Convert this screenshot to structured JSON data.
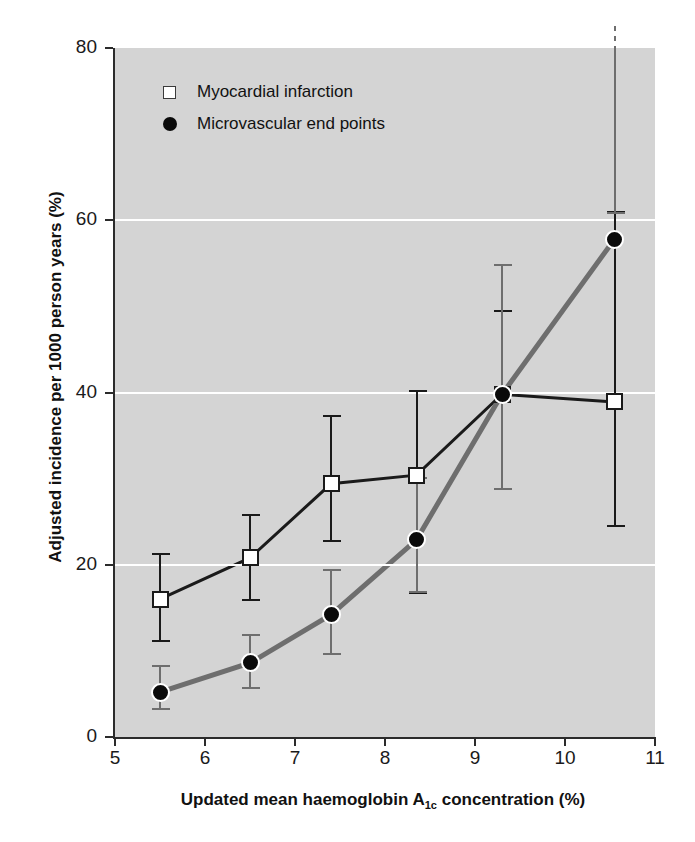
{
  "chart_data": {
    "type": "line",
    "title": "",
    "xlabel": "Updated mean haemoglobin A1c concentration (%)",
    "xlabel_parts": {
      "before": "Updated mean haemoglobin A",
      "sub": "1c",
      "after": " concentration (%)"
    },
    "ylabel": "Adjusted incidence per 1000 person years (%)",
    "xlim": [
      5,
      11
    ],
    "ylim": [
      0,
      80
    ],
    "xticks": [
      "5",
      "6",
      "7",
      "8",
      "9",
      "10",
      "11"
    ],
    "yticks": [
      "0",
      "20",
      "40",
      "60",
      "80"
    ],
    "grid": "horizontal-white-gridlines",
    "legend_position": "top-left-inside",
    "plot_background": "#d4d4d4",
    "x": [
      5.5,
      6.5,
      7.4,
      8.35,
      9.3,
      10.55
    ],
    "series": [
      {
        "name": "Myocardial infarction",
        "marker": "open-square",
        "color": "#1a1a1a",
        "values": [
          16.0,
          20.8,
          29.4,
          30.4,
          39.8,
          38.9
        ],
        "ci_low": [
          11.2,
          15.9,
          22.8,
          16.7,
          28.8,
          24.5
        ],
        "ci_high": [
          21.2,
          25.8,
          37.3,
          40.2,
          49.5,
          61.0
        ],
        "ci_high_clipped": [
          false,
          false,
          false,
          false,
          false,
          false
        ]
      },
      {
        "name": "Microvascular end points",
        "marker": "filled-circle",
        "color": "#6e6e6e",
        "values": [
          5.2,
          8.6,
          14.2,
          22.9,
          39.8,
          57.8
        ],
        "ci_low": [
          3.2,
          5.7,
          9.6,
          16.8,
          28.8,
          60.8
        ],
        "ci_high": [
          8.2,
          11.9,
          19.4,
          30.1,
          54.8,
          80.0
        ],
        "ci_high_clipped": [
          false,
          false,
          false,
          false,
          false,
          true
        ]
      }
    ]
  },
  "legend": {
    "items": [
      {
        "label": "Myocardial infarction",
        "swatch": "open-square-icon"
      },
      {
        "label": "Microvascular end points",
        "swatch": "filled-circle-icon"
      }
    ]
  }
}
